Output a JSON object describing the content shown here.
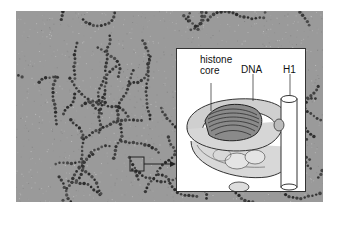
{
  "figure": {
    "micrograph": {
      "description": "electron micrograph of chromatin fibers (beads on a string)"
    },
    "marker_box": {
      "x": 130,
      "y": 157,
      "size": 14
    },
    "inset": {
      "labels": {
        "histone_core": "histone\ncore",
        "histone_line1": "histone",
        "histone_line2": "core",
        "dna": "DNA",
        "h1": "H1"
      }
    }
  }
}
